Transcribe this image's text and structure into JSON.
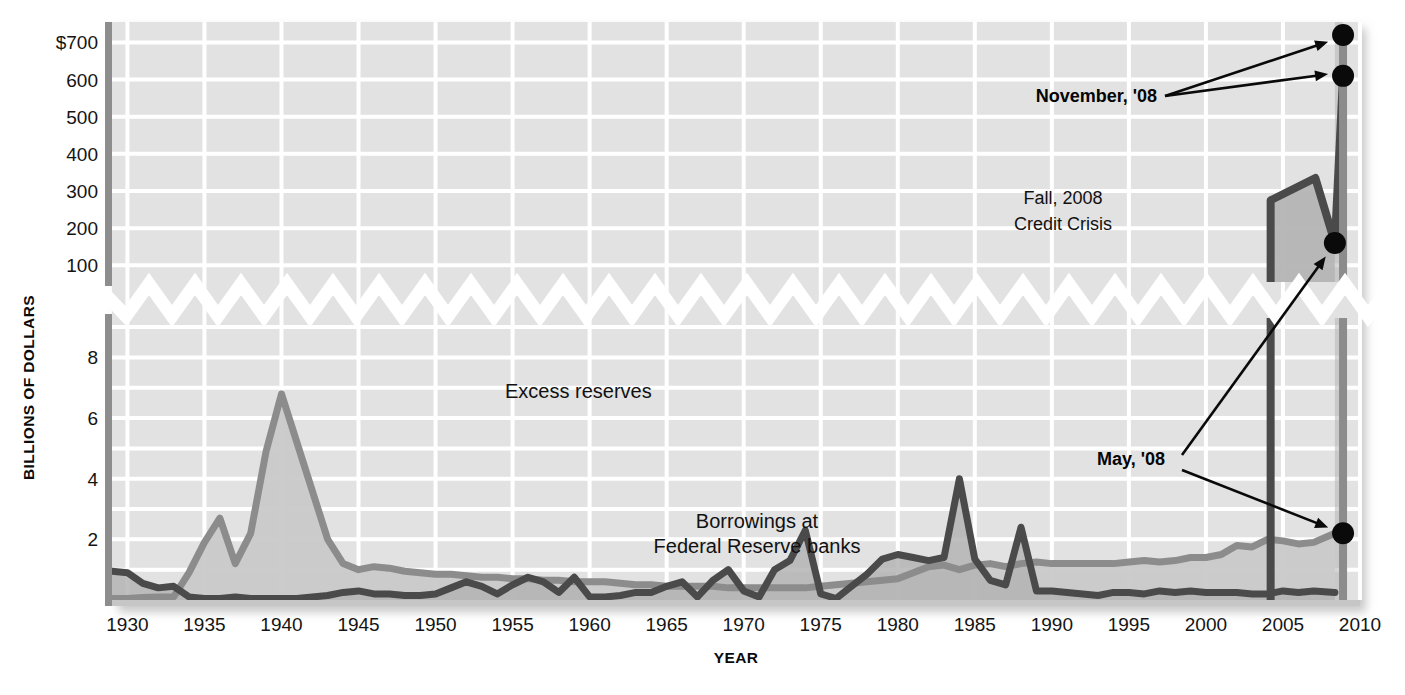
{
  "figure": {
    "background": "#ffffff",
    "plot_background": "#e2e2e2",
    "gridline_color": "#ffffff",
    "axis_color": "#8d8d8d",
    "break_color": "#ffffff"
  },
  "axes": {
    "y_title": "BILLIONS OF DOLLARS",
    "x_title": "YEAR",
    "y_upper_ticks": [
      "$700",
      "600",
      "500",
      "400",
      "300",
      "200",
      "100"
    ],
    "y_lower_ticks": [
      "8",
      "6",
      "4",
      "2"
    ],
    "x_ticks": [
      "1930",
      "1935",
      "1940",
      "1945",
      "1950",
      "1955",
      "1960",
      "1965",
      "1970",
      "1975",
      "1980",
      "1985",
      "1990",
      "1995",
      "2000",
      "2005",
      "2010"
    ],
    "y_axis_break": true,
    "grid": true
  },
  "series_labels": {
    "excess": "Excess reserves",
    "borrowings_line1": "Borrowings at",
    "borrowings_line2": "Federal Reserve banks"
  },
  "annotations": {
    "fall_line1": "Fall, 2008",
    "fall_line2": "Credit Crisis",
    "november": "November, '08",
    "may": "May, '08"
  },
  "colors": {
    "excess_reserves_line": "#8c8c8c",
    "borrowings_line": "#4a4a4a",
    "fill_excess": "#c9c9c9",
    "fill_borrowings": "#b4b4b4",
    "marker": "#0a0a0a"
  },
  "chart_data": {
    "type": "line",
    "title": "",
    "xlabel": "YEAR",
    "ylabel": "BILLIONS OF DOLLARS",
    "xlim": [
      1929,
      2010
    ],
    "ylim_lower": [
      0,
      9
    ],
    "ylim_upper": [
      100,
      750
    ],
    "axis_break": {
      "between": [
        9,
        100
      ],
      "style": "zigzag"
    },
    "legend_position": "inline-labels",
    "grid": true,
    "series": [
      {
        "name": "Excess reserves",
        "color": "#8c8c8c",
        "x": [
          1929,
          1930,
          1931,
          1932,
          1933,
          1934,
          1935,
          1936,
          1937,
          1938,
          1939,
          1940,
          1941,
          1942,
          1943,
          1944,
          1945,
          1946,
          1947,
          1948,
          1949,
          1950,
          1951,
          1952,
          1953,
          1954,
          1955,
          1956,
          1957,
          1958,
          1959,
          1960,
          1961,
          1962,
          1963,
          1964,
          1965,
          1966,
          1967,
          1968,
          1969,
          1970,
          1971,
          1972,
          1973,
          1974,
          1975,
          1976,
          1977,
          1978,
          1979,
          1980,
          1981,
          1982,
          1983,
          1984,
          1985,
          1986,
          1987,
          1988,
          1989,
          1990,
          1991,
          1992,
          1993,
          1994,
          1995,
          1996,
          1997,
          1998,
          1999,
          2000,
          2001,
          2002,
          2003,
          2004,
          2005,
          2006,
          2007,
          2008.37
        ],
        "y": [
          0.05,
          0.05,
          0.08,
          0.1,
          0.1,
          0.9,
          1.9,
          2.7,
          1.2,
          2.2,
          4.9,
          6.8,
          5.2,
          3.6,
          2.0,
          1.2,
          1.0,
          1.1,
          1.05,
          0.95,
          0.9,
          0.85,
          0.85,
          0.8,
          0.75,
          0.75,
          0.7,
          0.7,
          0.65,
          0.65,
          0.6,
          0.6,
          0.6,
          0.55,
          0.5,
          0.5,
          0.45,
          0.45,
          0.45,
          0.45,
          0.4,
          0.4,
          0.4,
          0.4,
          0.4,
          0.4,
          0.45,
          0.5,
          0.55,
          0.6,
          0.65,
          0.7,
          0.9,
          1.1,
          1.15,
          1.0,
          1.15,
          1.2,
          1.1,
          1.2,
          1.25,
          1.2,
          1.2,
          1.2,
          1.2,
          1.2,
          1.25,
          1.3,
          1.25,
          1.3,
          1.4,
          1.4,
          1.5,
          1.8,
          1.75,
          2.0,
          1.95,
          1.85,
          1.9,
          2.2
        ],
        "break_segment": {
          "x": [
            2008.37,
            2008.9
          ],
          "y_lower": 2.2,
          "y_upper": 720
        }
      },
      {
        "name": "Borrowings at Federal Reserve banks",
        "color": "#4a4a4a",
        "x": [
          1929,
          1930,
          1931,
          1932,
          1933,
          1934,
          1935,
          1936,
          1937,
          1938,
          1939,
          1940,
          1941,
          1942,
          1943,
          1944,
          1945,
          1946,
          1947,
          1948,
          1949,
          1950,
          1951,
          1952,
          1953,
          1954,
          1955,
          1956,
          1957,
          1958,
          1959,
          1960,
          1961,
          1962,
          1963,
          1964,
          1965,
          1966,
          1967,
          1968,
          1969,
          1970,
          1971,
          1972,
          1973,
          1974,
          1975,
          1976,
          1977,
          1978,
          1979,
          1980,
          1981,
          1982,
          1983,
          1984,
          1985,
          1986,
          1987,
          1988,
          1989,
          1990,
          1991,
          1992,
          1993,
          1994,
          1995,
          1996,
          1997,
          1998,
          1999,
          2000,
          2001,
          2002,
          2003,
          2004,
          2005,
          2006,
          2007,
          2008.37
        ],
        "y": [
          0.95,
          0.9,
          0.55,
          0.4,
          0.45,
          0.1,
          0.05,
          0.05,
          0.1,
          0.05,
          0.05,
          0.05,
          0.05,
          0.1,
          0.15,
          0.25,
          0.3,
          0.2,
          0.2,
          0.15,
          0.15,
          0.2,
          0.4,
          0.6,
          0.45,
          0.2,
          0.5,
          0.75,
          0.6,
          0.25,
          0.75,
          0.1,
          0.1,
          0.15,
          0.25,
          0.25,
          0.45,
          0.6,
          0.1,
          0.65,
          1.0,
          0.3,
          0.1,
          1.0,
          1.3,
          2.3,
          0.2,
          0.05,
          0.45,
          0.85,
          1.35,
          1.5,
          1.4,
          1.3,
          1.4,
          4.0,
          1.35,
          0.65,
          0.5,
          2.4,
          0.3,
          0.3,
          0.25,
          0.2,
          0.15,
          0.25,
          0.25,
          0.2,
          0.3,
          0.25,
          0.3,
          0.25,
          0.25,
          0.25,
          0.2,
          0.2,
          0.3,
          0.25,
          0.3,
          0.25
        ],
        "crisis_spike": {
          "x": 2004.2,
          "to_value_upper": 275,
          "peak_upper": 335,
          "peak_x": 2007.1,
          "end_value_upper": 160,
          "end_x": 2008.37
        }
      }
    ],
    "markers": [
      {
        "label": "November, '08",
        "x": 2008.9,
        "value": 720,
        "series": "Excess reserves"
      },
      {
        "label": "November, '08",
        "x": 2008.9,
        "value": 610,
        "series": "Borrowings at Federal Reserve banks"
      },
      {
        "label": "May, '08",
        "x": 2008.37,
        "value": 160,
        "series": "Borrowings at Federal Reserve banks"
      },
      {
        "label": "May, '08",
        "x": 2008.37,
        "value": 2.2,
        "series": "Excess reserves"
      }
    ],
    "annotations": [
      {
        "text": "Fall, 2008 Credit Crisis",
        "x": 2001,
        "value_upper": 300
      },
      {
        "text": "Excess reserves",
        "x": 1944,
        "value_lower": 6.6
      },
      {
        "text": "Borrowings at Federal Reserve banks",
        "x": 1966,
        "value_lower": 2.6
      }
    ]
  }
}
